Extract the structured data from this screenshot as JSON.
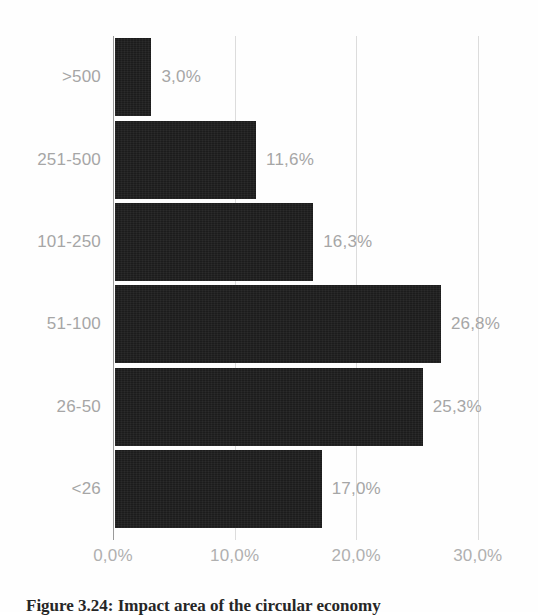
{
  "figure": {
    "background_color": "#fefefe",
    "caption": "Figure 3.24: Impact area of the circular economy",
    "bar_color": "#1c1c1c",
    "label_color": "#a6a6a6",
    "gridline_color": "#dcdcdc",
    "axis_color": "#9a9a9a"
  },
  "chart_data": {
    "type": "bar",
    "orientation": "horizontal",
    "title": "",
    "xlabel": "",
    "ylabel": "",
    "categories": [
      ">500",
      "251-500",
      "101-250",
      "51-100",
      "26-50",
      "<26"
    ],
    "values": [
      3.0,
      11.6,
      16.3,
      26.8,
      25.3,
      17.0
    ],
    "value_labels": [
      "3,0%",
      "11,6%",
      "16,3%",
      "26,8%",
      "25,3%",
      "17,0%"
    ],
    "xlim": [
      0,
      30
    ],
    "xticks": [
      0,
      10,
      20,
      30
    ],
    "xtick_labels": [
      "0,0%",
      "10,0%",
      "20,0%",
      "30,0%"
    ],
    "grid": true,
    "grid_axis": "x",
    "legend": false,
    "decimal_separator": ","
  }
}
